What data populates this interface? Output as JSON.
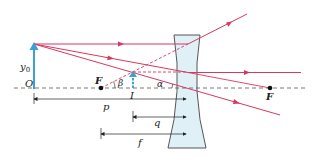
{
  "diagram": {
    "type": "diverging-lens-ray-diagram",
    "colors": {
      "ray": "#d8385e",
      "axis": "#555555",
      "object_arrow": "#3aa0d6",
      "lens_fill": "#dff0f7",
      "lens_stroke": "#555555",
      "dimension": "#222222",
      "focal_point": "#111111"
    },
    "labels": {
      "object_height": "y",
      "object_height_sub": "0",
      "origin": "O",
      "focal_left": "F",
      "focal_right": "F",
      "image": "I",
      "angle_beta": "β",
      "angle_alpha": "α",
      "object_distance": "p",
      "image_distance": "q",
      "focal_length": "f"
    },
    "geometry": {
      "optical_axis_y": 88,
      "object": {
        "x": 34,
        "base_y": 88,
        "tip_y": 44
      },
      "image": {
        "x": 133,
        "base_y": 88,
        "tip_y": 72
      },
      "lens_center_x": 187,
      "lens_top_y": 35,
      "lens_bottom_y": 148,
      "focal_left_x": 101,
      "focal_right_x": 270
    }
  }
}
